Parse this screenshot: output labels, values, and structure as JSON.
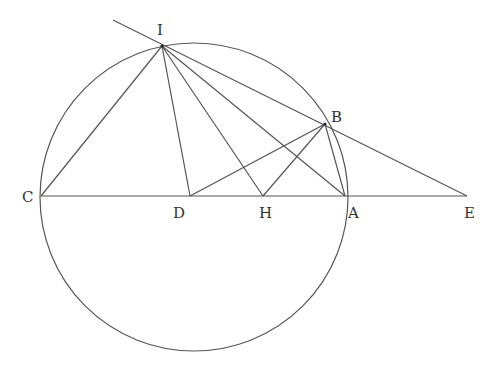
{
  "diagram": {
    "type": "geometry",
    "stroke_color": "#555555",
    "label_color": "#333333",
    "circle": {
      "name": "circle",
      "cx": 194,
      "cy": 197,
      "r": 154
    },
    "points": {
      "I": {
        "label": "I",
        "x": 162,
        "y": 46,
        "lx": 157,
        "ly": 35
      },
      "B": {
        "label": "B",
        "x": 325,
        "y": 124,
        "lx": 331,
        "ly": 122
      },
      "C": {
        "label": "C",
        "x": 41,
        "y": 196,
        "lx": 22,
        "ly": 202
      },
      "D": {
        "label": "D",
        "x": 190,
        "y": 196,
        "lx": 173,
        "ly": 218
      },
      "H": {
        "label": "H",
        "x": 263,
        "y": 196,
        "lx": 259,
        "ly": 218
      },
      "A": {
        "label": "A",
        "x": 345,
        "y": 196,
        "lx": 348,
        "ly": 218
      },
      "E": {
        "label": "E",
        "x": 467,
        "y": 196,
        "lx": 464,
        "ly": 218
      }
    },
    "segments": [
      {
        "name": "line-C-E",
        "from": "C",
        "to": "E"
      },
      {
        "name": "line-I-E-extended",
        "x1": 113,
        "y1": 20,
        "x2": 467,
        "y2": 196
      },
      {
        "name": "line-I-C",
        "from": "I",
        "to": "C"
      },
      {
        "name": "line-I-D",
        "from": "I",
        "to": "D"
      },
      {
        "name": "line-I-H",
        "from": "I",
        "to": "H"
      },
      {
        "name": "line-I-A",
        "from": "I",
        "to": "A"
      },
      {
        "name": "line-B-D",
        "from": "B",
        "to": "D"
      },
      {
        "name": "line-B-H",
        "from": "B",
        "to": "H"
      },
      {
        "name": "line-B-A",
        "from": "B",
        "to": "A"
      }
    ],
    "labels": [
      "I",
      "B",
      "C",
      "D",
      "H",
      "A",
      "E"
    ]
  }
}
